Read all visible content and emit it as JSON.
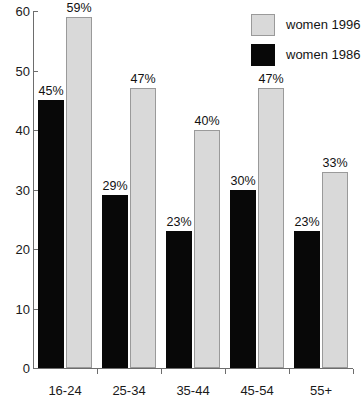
{
  "chart_data": {
    "type": "bar",
    "title": "",
    "subtitle": "",
    "xlabel": "",
    "ylabel": "",
    "categories": [
      "16-24",
      "25-34",
      "35-44",
      "45-54",
      "55+"
    ],
    "series": [
      {
        "name": "women 1996",
        "color": "#d9d9d9",
        "values": [
          59,
          47,
          40,
          47,
          33
        ],
        "labels": [
          "59%",
          "47%",
          "40%",
          "47%",
          "33%"
        ]
      },
      {
        "name": "women 1986",
        "color": "#080808",
        "values": [
          45,
          29,
          23,
          30,
          23
        ],
        "labels": [
          "45%",
          "29%",
          "23%",
          "30%",
          "23%"
        ]
      }
    ],
    "series_draw_order": [
      "women 1986",
      "women 1996"
    ],
    "ylim": [
      0,
      60
    ],
    "yticks": [
      0,
      10,
      20,
      30,
      40,
      50,
      60
    ],
    "ytick_labels": [
      "0",
      "10",
      "20",
      "30",
      "40",
      "50",
      "60"
    ],
    "grid": false,
    "legend_position": "top-right",
    "legend_entries": [
      "women 1996",
      "women 1986"
    ],
    "annotations": [
      "Data labels shown above every bar as percentages"
    ]
  },
  "axes": {
    "y_tick_labels": [
      "60",
      "50",
      "40",
      "30",
      "20",
      "10",
      "0"
    ],
    "x_tick_labels": [
      "16-24",
      "25-34",
      "35-44",
      "45-54",
      "55+"
    ]
  },
  "legend": {
    "items": [
      {
        "label": "women 1996",
        "swatch": "light-grey-swatch"
      },
      {
        "label": "women 1986",
        "swatch": "black-swatch"
      }
    ]
  }
}
